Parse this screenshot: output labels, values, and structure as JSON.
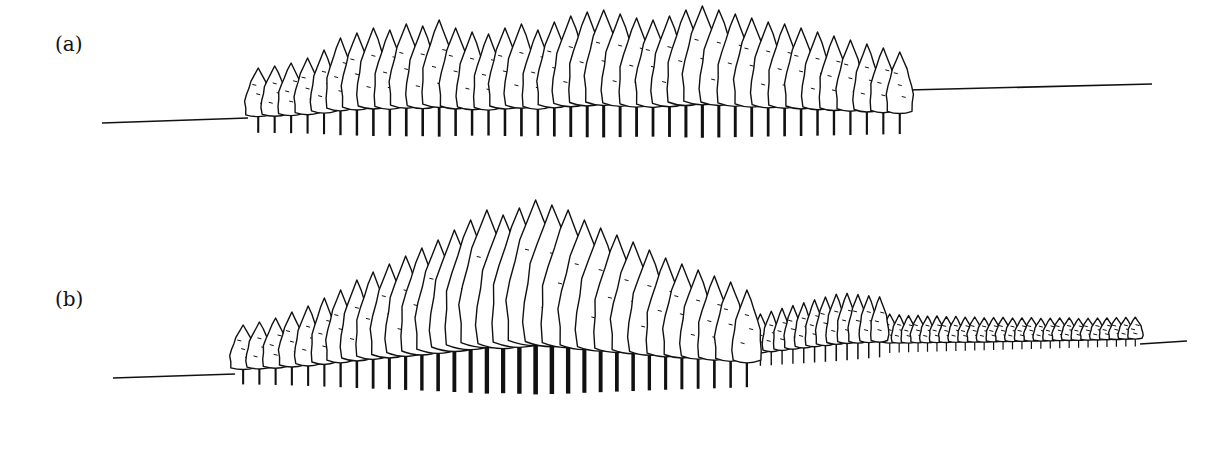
{
  "panels": [
    {
      "label": "(a)",
      "label_pos": [
        55,
        32
      ],
      "ground_left": [
        [
          102,
          123
        ],
        [
          248,
          118
        ]
      ],
      "ground_right": [
        [
          908,
          90
        ],
        [
          1152,
          84
        ]
      ],
      "stand": {
        "x0": 250,
        "x1": 908,
        "base_left": 128,
        "base_right": 128,
        "heights": [
          60,
          62,
          65,
          70,
          78,
          90,
          95,
          100,
          98,
          104,
          102,
          108,
          100,
          96,
          94,
          100,
          104,
          98,
          106,
          112,
          116,
          118,
          114,
          110,
          108,
          112,
          118,
          122,
          118,
          114,
          110,
          106,
          104,
          100,
          96,
          92,
          88,
          84,
          80,
          76
        ]
      }
    },
    {
      "label": "(b)",
      "label_pos": [
        55,
        287
      ],
      "ground_left": [
        [
          113,
          378
        ],
        [
          235,
          374
        ]
      ],
      "ground_right": [
        [
          1140,
          344
        ],
        [
          1187,
          341
        ]
      ],
      "stand": {
        "x0": 235,
        "x1": 755,
        "base_left": 380,
        "base_right": 380,
        "heights": [
          55,
          58,
          62,
          68,
          74,
          82,
          90,
          100,
          108,
          116,
          124,
          132,
          140,
          150,
          160,
          170,
          165,
          172,
          180,
          175,
          170,
          160,
          152,
          145,
          138,
          130,
          122,
          116,
          110,
          104,
          98,
          90
        ]
      },
      "stand2": {
        "x0": 755,
        "x1": 885,
        "base_left": 362,
        "base_right": 352,
        "heights": [
          48,
          50,
          52,
          54,
          56,
          58,
          60,
          62,
          62,
          60,
          58,
          56
        ]
      },
      "stand3": {
        "x0": 885,
        "x1": 1140,
        "base_left": 350,
        "base_right": 344,
        "heights": [
          36,
          35,
          34,
          34,
          33,
          33,
          32,
          32,
          31,
          31,
          30,
          30,
          30,
          29,
          29,
          29,
          28,
          28,
          28,
          28,
          27,
          27,
          27,
          27,
          27,
          27,
          27
        ]
      }
    }
  ]
}
